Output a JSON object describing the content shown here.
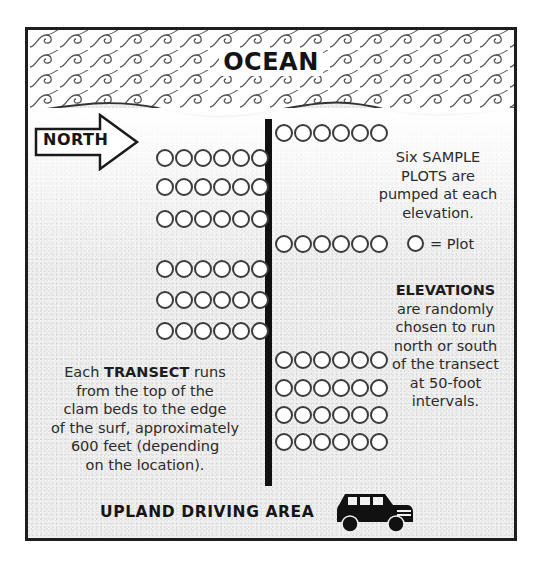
{
  "title": "OCEAN",
  "north_arrow": {
    "label": "NORTH"
  },
  "transect": {
    "label": "transect line"
  },
  "plot_rows": {
    "right": [
      {
        "y": 94,
        "count": 6
      },
      {
        "y": 205,
        "count": 6
      },
      {
        "y": 321,
        "count": 6
      },
      {
        "y": 349,
        "count": 6
      },
      {
        "y": 376,
        "count": 6
      },
      {
        "y": 403,
        "count": 6
      }
    ],
    "left": [
      {
        "y": 119,
        "count": 6
      },
      {
        "y": 148,
        "count": 6
      },
      {
        "y": 180,
        "count": 6
      },
      {
        "y": 230,
        "count": 6
      },
      {
        "y": 261,
        "count": 6
      },
      {
        "y": 292,
        "count": 6
      }
    ]
  },
  "sample_plots_note": {
    "lines": [
      "Six SAMPLE",
      "PLOTS are",
      "pumped at each",
      "elevation."
    ]
  },
  "legend": {
    "symbol": "circle-icon",
    "label": "= Plot"
  },
  "elevations_note": {
    "heading": "ELEVATIONS",
    "lines": [
      "are randomly",
      "chosen to run",
      "north or south",
      "of the transect",
      "at 50-foot",
      "intervals."
    ]
  },
  "transect_note": {
    "line1_pre": "Each ",
    "line1_bold": "TRANSECT",
    "line1_post": " runs",
    "lines": [
      "from the top of the",
      "clam beds to the edge",
      "of the surf, approximately",
      "600 feet (depending",
      "on the location)."
    ]
  },
  "footer": {
    "label": "UPLAND DRIVING AREA",
    "icon": "suv-icon"
  },
  "colors": {
    "ink": "#111111",
    "paper": "#ffffff",
    "sand": "#f1f1f1",
    "circle": "#3b3b3b"
  }
}
